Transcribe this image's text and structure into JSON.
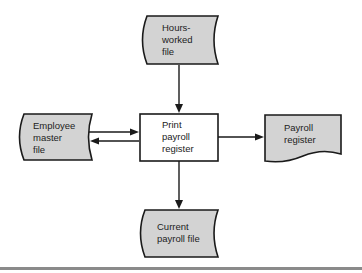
{
  "diagram": {
    "type": "system-flowchart",
    "nodes": [
      {
        "id": "hours-worked-file",
        "kind": "file-storage",
        "lines": [
          "Hours-",
          "worked",
          "file"
        ]
      },
      {
        "id": "employee-master-file",
        "kind": "file-storage",
        "lines": [
          "Employee",
          "master",
          "file"
        ]
      },
      {
        "id": "print-payroll-register",
        "kind": "process",
        "lines": [
          "Print",
          "payroll",
          "register"
        ]
      },
      {
        "id": "payroll-register",
        "kind": "document",
        "lines": [
          "Payroll",
          "register"
        ]
      },
      {
        "id": "current-payroll-file",
        "kind": "file-storage",
        "lines": [
          "Current",
          "payroll file"
        ]
      }
    ],
    "edges": [
      {
        "from": "hours-worked-file",
        "to": "print-payroll-register"
      },
      {
        "from": "employee-master-file",
        "to": "print-payroll-register"
      },
      {
        "from": "print-payroll-register",
        "to": "employee-master-file"
      },
      {
        "from": "print-payroll-register",
        "to": "payroll-register"
      },
      {
        "from": "print-payroll-register",
        "to": "current-payroll-file"
      }
    ],
    "colors": {
      "storage_fill": "#d3d3d3",
      "process_fill": "#ffffff",
      "stroke": "#1a1a1a",
      "rule": "#8a8a8a"
    }
  }
}
